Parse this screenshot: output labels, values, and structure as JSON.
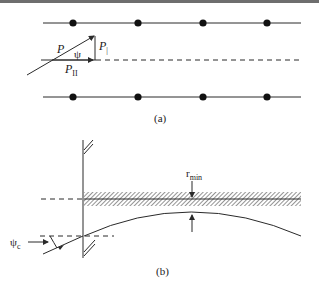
{
  "figure": {
    "panel_a": {
      "caption": "(a)",
      "labels": {
        "P": "P",
        "psi": "ψ",
        "P_perp_base": "P",
        "P_perp_sub": "⊥",
        "P_par_base": "P",
        "P_par_sub": "II"
      },
      "atom_rows": 2,
      "atoms_per_row": 4
    },
    "panel_b": {
      "caption": "(b)",
      "labels": {
        "r_min_base": "r",
        "r_min_sub": "min",
        "psi_c_base": "ψ",
        "psi_c_sub": "c"
      }
    },
    "colors": {
      "line": "#2a2a2a",
      "top_bar": "#6e6e6e",
      "background": "#ffffff"
    }
  }
}
